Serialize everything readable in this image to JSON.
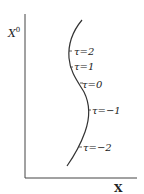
{
  "diagram": {
    "y_axis_label": "X",
    "y_axis_superscript": "0",
    "x_axis_label": "X",
    "curve_color": "#333333",
    "axis_color": "#444444",
    "tick_labels": [
      {
        "text": "τ=2"
      },
      {
        "text": "τ=1"
      },
      {
        "text": "τ=0"
      },
      {
        "text": "τ=−1"
      },
      {
        "text": "τ=−2"
      }
    ]
  }
}
